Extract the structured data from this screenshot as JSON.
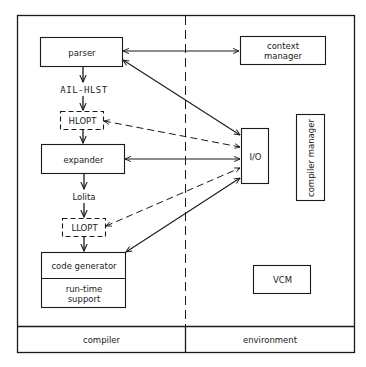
{
  "diagram": {
    "sections": {
      "left": "compiler",
      "right": "environment"
    },
    "compiler_nodes": {
      "parser": "parser",
      "ail_hlst": "AIL-HLST",
      "hlopt": "HLOPT",
      "expander": "expander",
      "lolita": "Lolita",
      "llopt": "LLOPT",
      "code_generator": "code generator",
      "runtime_support": "run-time support"
    },
    "environment_nodes": {
      "context_manager": "context manager",
      "io": "I/O",
      "compiler_manager": "compiler manager",
      "vcm": "VCM"
    },
    "edges": [
      {
        "from": "parser",
        "to": "context manager",
        "style": "solid",
        "direction": "both"
      },
      {
        "from": "parser",
        "to": "I/O",
        "style": "solid",
        "direction": "both"
      },
      {
        "from": "parser",
        "to": "AIL-HLST",
        "style": "solid",
        "direction": "forward"
      },
      {
        "from": "AIL-HLST",
        "to": "HLOPT",
        "style": "solid",
        "direction": "forward"
      },
      {
        "from": "HLOPT",
        "to": "expander",
        "style": "solid",
        "direction": "forward"
      },
      {
        "from": "HLOPT",
        "to": "I/O",
        "style": "dashed",
        "direction": "both"
      },
      {
        "from": "expander",
        "to": "I/O",
        "style": "solid",
        "direction": "both"
      },
      {
        "from": "expander",
        "to": "Lolita",
        "style": "solid",
        "direction": "forward"
      },
      {
        "from": "Lolita",
        "to": "LLOPT",
        "style": "solid",
        "direction": "forward"
      },
      {
        "from": "LLOPT",
        "to": "code generator",
        "style": "solid",
        "direction": "forward"
      },
      {
        "from": "LLOPT",
        "to": "I/O",
        "style": "dashed",
        "direction": "both"
      },
      {
        "from": "code generator",
        "to": "I/O",
        "style": "solid",
        "direction": "both"
      }
    ]
  }
}
